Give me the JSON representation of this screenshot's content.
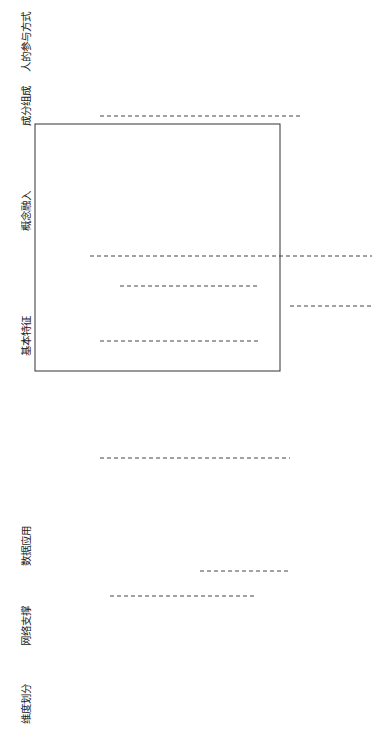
{
  "headers": {
    "dimension": "维度划分",
    "network": "网络支撑",
    "data_app": "数据应用",
    "features": "基本特征",
    "concepts": "概念融入",
    "composition": "成分组成",
    "human": "人的参与方式"
  },
  "dimensions": {
    "info": "信息维度",
    "physical": "物理维度"
  },
  "network": [
    "6G",
    "5G",
    "4G"
  ],
  "data_app": [
    [
      "脑机接口",
      "社交数据"
    ],
    [
      "工业控制接口"
    ],
    [
      "区块链"
    ],
    [
      "云计算",
      "大数据分析"
    ],
    [
      "实时数据驱动"
    ],
    [
      "离线数据"
    ],
    [
      "模型数据"
    ]
  ],
  "virtual_labels": [
    "虚拟控制",
    "虚拟决策",
    "虚拟监测"
  ],
  "features": [
    "①展示与离线模拟",
    "②监测与辅助操作",
    "③在线模拟与预演",
    "④预测与决策",
    "⑤反向控制",
    "⑥人机融合与管理"
  ],
  "concepts": [
    "虚拟现实(VR)",
    "增强现实(AR)",
    "数字孪生(DT)",
    "平行系统(PS)",
    "信息物理系统(CPS)",
    "工业元宇宙(IM)"
  ],
  "physical_system": "物理系统",
  "goal": "最终目标：信息系统为物理系统安全高效智能运行提供支撑",
  "composition": [
    "实∞",
    "实>虚",
    "实=虚",
    "虚>实",
    "虚∞"
  ],
  "human": [
    [
      "现场观测",
      "主观决策",
      "现场操作"
    ],
    [
      "虚拟界面观测",
      "自主决策",
      "现场操作"
    ],
    [
      "虚拟界面观测",
      "监督计算机的",
      "决策结果",
      "现场操作"
    ],
    [
      "虚拟人操作",
      "实体人总体管理"
    ]
  ]
}
